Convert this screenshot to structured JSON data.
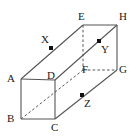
{
  "figure": {
    "kind": "geometry-diagram",
    "shape": "rectangular-prism",
    "title": "",
    "background_color": "#ffffff",
    "line_color": "#555555",
    "dash_color": "#555555",
    "point_color": "#111111",
    "label_color": "#1a1a1a",
    "width": 138,
    "height": 136
  },
  "vertices": [
    {
      "id": "A",
      "label": "A",
      "x": 21,
      "y": 79,
      "label_x": 7,
      "label_y": 73,
      "hidden": false
    },
    {
      "id": "B",
      "label": "B",
      "x": 21,
      "y": 119,
      "label_x": 7,
      "label_y": 113,
      "hidden": false
    },
    {
      "id": "C",
      "label": "C",
      "x": 55,
      "y": 119,
      "label_x": 51,
      "label_y": 122,
      "hidden": false
    },
    {
      "id": "D",
      "label": "D",
      "x": 55,
      "y": 80,
      "label_x": 47,
      "label_y": 70,
      "hidden": false
    },
    {
      "id": "E",
      "label": "E",
      "x": 83,
      "y": 25,
      "label_x": 78,
      "label_y": 11,
      "hidden": false
    },
    {
      "id": "F",
      "label": "F",
      "x": 83,
      "y": 70,
      "label_x": 82,
      "label_y": 64,
      "hidden": true
    },
    {
      "id": "G",
      "label": "G",
      "x": 117,
      "y": 70,
      "label_x": 119,
      "label_y": 64,
      "hidden": false
    },
    {
      "id": "H",
      "label": "H",
      "x": 117,
      "y": 25,
      "label_x": 119,
      "label_y": 11,
      "hidden": false
    }
  ],
  "marked_points": [
    {
      "id": "X",
      "label": "X",
      "x": 51,
      "y": 48,
      "label_x": 41,
      "label_y": 34
    },
    {
      "id": "Y",
      "label": "Y",
      "x": 99,
      "y": 41,
      "label_x": 101,
      "label_y": 44
    },
    {
      "id": "Z",
      "label": "Z",
      "x": 82,
      "y": 95,
      "label_x": 84,
      "label_y": 98
    }
  ],
  "solid_edges": [
    {
      "from": "A",
      "to": "B"
    },
    {
      "from": "B",
      "to": "C"
    },
    {
      "from": "C",
      "to": "D"
    },
    {
      "from": "D",
      "to": "A"
    },
    {
      "from": "A",
      "to": "E"
    },
    {
      "from": "D",
      "to": "H"
    },
    {
      "from": "C",
      "to": "G"
    },
    {
      "from": "E",
      "to": "H"
    },
    {
      "from": "H",
      "to": "G"
    }
  ],
  "dashed_edges": [
    {
      "from": "E",
      "to": "F"
    },
    {
      "from": "F",
      "to": "G"
    },
    {
      "from": "B",
      "to": "F"
    }
  ],
  "notes": {
    "front_face": "ABCD",
    "back_face": "EFGH",
    "space_diagonal": "B to F (dashed, through D region)",
    "point_X_on": "edge A-E",
    "point_Y_on": "diagonal D-H / E-G region",
    "point_Z_on": "edge C-G"
  }
}
